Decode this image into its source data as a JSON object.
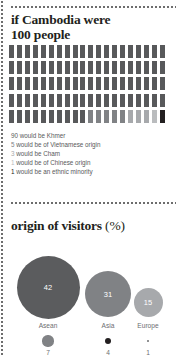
{
  "section1": {
    "title_line1": "if Cambodia were",
    "title_line2": "100 people",
    "total_people": 100,
    "legend": [
      {
        "number": "90",
        "text": "would be Khmer",
        "color": "#58595b"
      },
      {
        "number": "5",
        "text": "would be of Vietnamese origin",
        "color": "#808285"
      },
      {
        "number": "3",
        "text": "would be Cham",
        "color": "#a7a9ac"
      },
      {
        "number": "1",
        "text": "would be of Chinese origin",
        "color": "#babcbe"
      },
      {
        "number": "1",
        "text": "would be an ethnic minority",
        "color": "#231f20"
      }
    ],
    "pictogram_groups": [
      {
        "name": "khmer",
        "count": 90,
        "color": "#58595b"
      },
      {
        "name": "vietnamese-origin",
        "count": 5,
        "color": "#808285"
      },
      {
        "name": "cham",
        "count": 3,
        "color": "#a7a9ac"
      },
      {
        "name": "chinese-origin",
        "count": 1,
        "color": "#babcbe"
      },
      {
        "name": "ethnic-minority",
        "count": 1,
        "color": "#231f20"
      }
    ]
  },
  "section2": {
    "title": "origin of visitors",
    "title_unit": "(%)"
  },
  "chart_data": {
    "type": "bubble",
    "title": "origin of visitors (%)",
    "unit": "%",
    "categories": [
      "Asean",
      "Asia",
      "Europe",
      "",
      "",
      ""
    ],
    "series": [
      {
        "name": "origin of visitors",
        "points": [
          {
            "label": "Asean",
            "value": 42,
            "color": "#5b5c5e",
            "radius_px": 31.5,
            "cx": 48,
            "cy": 47,
            "show_value": true,
            "value_color": "#ffffff"
          },
          {
            "label": "Asia",
            "value": 31,
            "color": "#808285",
            "radius_px": 23.0,
            "cx": 108,
            "cy": 54,
            "show_value": true,
            "value_color": "#ffffff"
          },
          {
            "label": "Europe",
            "value": 15,
            "color": "#a7a9ac",
            "radius_px": 14.5,
            "cx": 148,
            "cy": 62,
            "show_value": true,
            "value_color": "#ffffff"
          },
          {
            "label": "",
            "value": 7,
            "color": "#808285",
            "radius_px": 5.6,
            "cx": 48,
            "cy": 101,
            "show_value": false,
            "value_color": "#6d6e71"
          },
          {
            "label": "",
            "value": 4,
            "color": "#231f20",
            "radius_px": 3.4,
            "cx": 108,
            "cy": 101,
            "show_value": false,
            "value_color": "#6d6e71"
          },
          {
            "label": "",
            "value": 1,
            "color": "#6d6e71",
            "radius_px": 1.1,
            "cx": 148,
            "cy": 101,
            "show_value": false,
            "value_color": "#6d6e71"
          }
        ]
      }
    ],
    "labels_row": [
      {
        "text": "Asean",
        "x": 48,
        "y": 82
      },
      {
        "text": "Asia",
        "x": 108,
        "y": 82
      },
      {
        "text": "Europe",
        "x": 148,
        "y": 82
      }
    ],
    "values_row": [
      {
        "text": "7",
        "x": 48,
        "y": 109
      },
      {
        "text": "4",
        "x": 108,
        "y": 109
      },
      {
        "text": "1",
        "x": 148,
        "y": 109
      }
    ]
  }
}
